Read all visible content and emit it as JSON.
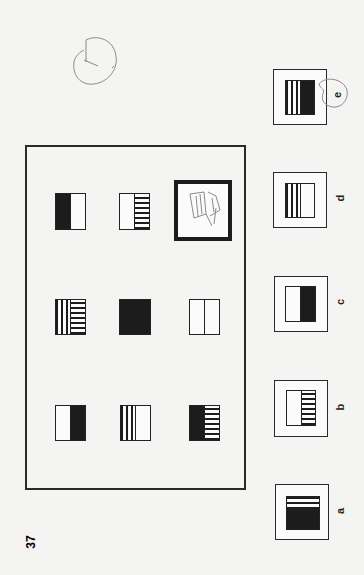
{
  "page": {
    "question_number": "37",
    "orientation": "rotated 90 degrees counter-clockwise",
    "background": "#f4f4f2",
    "ink_color": "#1c1c1c"
  },
  "matrix": {
    "rows": [
      [
        {
          "left": "black",
          "right": "white"
        },
        {
          "left": "white",
          "right": "horizontal-lines"
        },
        {
          "answer_slot": true,
          "content": "pencil scribble"
        }
      ],
      [
        {
          "left": "vertical-lines",
          "right": "horizontal-lines"
        },
        {
          "left": "black",
          "right": "black"
        },
        {
          "left": "white",
          "right": "white"
        }
      ],
      [
        {
          "left": "white",
          "right": "black"
        },
        {
          "left": "vertical-lines",
          "right": "white"
        },
        {
          "left": "black",
          "right": "horizontal-lines"
        }
      ]
    ]
  },
  "options": [
    {
      "label": "a",
      "top": "horizontal-lines",
      "bottom": "black"
    },
    {
      "label": "b",
      "left": "white",
      "right": "horizontal-lines"
    },
    {
      "label": "c",
      "left": "white",
      "right": "black"
    },
    {
      "label": "d",
      "left": "vertical-lines",
      "right": "white"
    },
    {
      "label": "e",
      "left": "vertical-lines",
      "right": "black",
      "circled": true
    }
  ],
  "annotations": {
    "handwritten_answer_circle": "e",
    "handwritten_mark_top": "circled tick"
  }
}
